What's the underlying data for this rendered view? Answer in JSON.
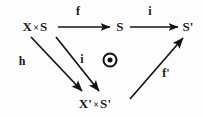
{
  "diagram": {
    "background_color": "#fdfdfd",
    "ink_color": "#1a1a1a",
    "nodes": [
      {
        "id": "top-left",
        "label": "X × S",
        "base": "X",
        "times": "×",
        "tail": "S",
        "x": 35,
        "y": 27
      },
      {
        "id": "top-mid",
        "label": "S",
        "base": "S",
        "times": "",
        "tail": "",
        "x": 120,
        "y": 27
      },
      {
        "id": "top-right",
        "label": "S'",
        "base": "S'",
        "times": "",
        "tail": "",
        "x": 188,
        "y": 27
      },
      {
        "id": "bottom-mid",
        "label": "X' × S'",
        "base": "X'",
        "times": "×",
        "tail": "S'",
        "x": 95,
        "y": 104
      }
    ],
    "edges": [
      {
        "id": "f",
        "label": "f",
        "from": "X × S",
        "to": "S",
        "label_x": 78,
        "label_y": 11
      },
      {
        "id": "i-top",
        "label": "i",
        "from": "S",
        "to": "S'",
        "label_x": 150,
        "label_y": 11
      },
      {
        "id": "h",
        "label": "h",
        "from": "X × S",
        "to": "X' × S'",
        "label_x": 22,
        "label_y": 61
      },
      {
        "id": "i-diag",
        "label": "i",
        "from": "X × S",
        "to": "X' × S'",
        "label_x": 82,
        "label_y": 59
      },
      {
        "id": "f-prime",
        "label": "f'",
        "from": "X' × S'",
        "to": "S'",
        "label_x": 166,
        "label_y": 73
      }
    ],
    "marker": {
      "name": "commutes-symbol",
      "glyph": "⊚",
      "x": 110,
      "y": 60
    }
  }
}
